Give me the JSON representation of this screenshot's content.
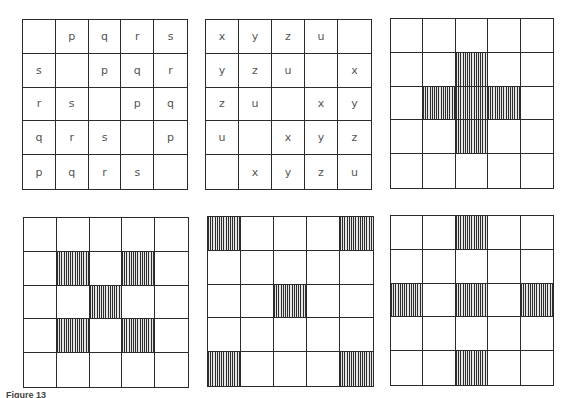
{
  "figure": {
    "caption": "Figure 13",
    "line_color": "#2a2a2a",
    "text_color": "#555555",
    "hatch_color": "#2d2d2d"
  },
  "grids": [
    {
      "id": "g1",
      "type": "letter-grid",
      "cells": [
        [
          "",
          "p",
          "q",
          "r",
          "s"
        ],
        [
          "s",
          "",
          "p",
          "q",
          "r"
        ],
        [
          "r",
          "s",
          "",
          "p",
          "q"
        ],
        [
          "q",
          "r",
          "s",
          "",
          "p"
        ],
        [
          "p",
          "q",
          "r",
          "s",
          ""
        ]
      ]
    },
    {
      "id": "g2",
      "type": "letter-grid",
      "cells": [
        [
          "x",
          "y",
          "z",
          "u",
          ""
        ],
        [
          "y",
          "z",
          "u",
          "",
          "x"
        ],
        [
          "z",
          "u",
          "",
          "x",
          "y"
        ],
        [
          "u",
          "",
          "x",
          "y",
          "z"
        ],
        [
          "",
          "x",
          "y",
          "z",
          "u"
        ]
      ]
    },
    {
      "id": "g3",
      "type": "shaded-grid",
      "pattern_name": "plus",
      "shaded": [
        [
          1,
          2
        ],
        [
          2,
          1
        ],
        [
          2,
          2
        ],
        [
          2,
          3
        ],
        [
          3,
          2
        ]
      ]
    },
    {
      "id": "g4",
      "type": "shaded-grid",
      "pattern_name": "x-diagonal",
      "shaded": [
        [
          1,
          1
        ],
        [
          1,
          3
        ],
        [
          2,
          2
        ],
        [
          3,
          1
        ],
        [
          3,
          3
        ]
      ]
    },
    {
      "id": "g5",
      "type": "shaded-grid",
      "pattern_name": "corners-and-center",
      "shaded": [
        [
          0,
          0
        ],
        [
          0,
          4
        ],
        [
          2,
          2
        ],
        [
          4,
          0
        ],
        [
          4,
          4
        ]
      ]
    },
    {
      "id": "g6",
      "type": "shaded-grid",
      "pattern_name": "edge-midpoints-and-center",
      "shaded": [
        [
          0,
          2
        ],
        [
          2,
          0
        ],
        [
          2,
          2
        ],
        [
          2,
          4
        ],
        [
          4,
          2
        ]
      ]
    }
  ]
}
